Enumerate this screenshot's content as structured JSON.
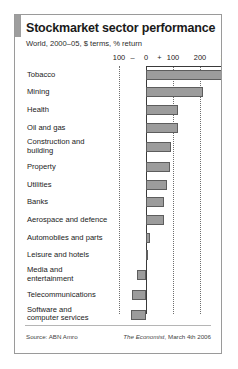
{
  "card": {
    "title": "Stockmarket sector performance",
    "subtitle": "World, 2000–05, $ terms, % return",
    "source_label": "Source: ABN Amro",
    "credit_brand": "The Economist",
    "credit_rest": ", March 4th 2006"
  },
  "axis": {
    "negative_sign": "–",
    "positive_sign": "+",
    "tick_labels": [
      "100",
      "0",
      "100",
      "200",
      "300"
    ]
  },
  "chart_data": {
    "type": "bar",
    "orientation": "horizontal",
    "title": "Stockmarket sector performance",
    "subtitle": "World, 2000–05, $ terms, % return",
    "xlabel": "% return",
    "ylabel": "",
    "xlim": [
      -100,
      300
    ],
    "xticks": [
      -100,
      0,
      100,
      200,
      300
    ],
    "xtick_labels": [
      "100",
      "0",
      "100",
      "200",
      "300"
    ],
    "grid": true,
    "legend": false,
    "categories": [
      "Tobacco",
      "Mining",
      "Health",
      "Oil and gas",
      "Construction and\nbuilding",
      "Property",
      "Utilities",
      "Banks",
      "Aerospace and defence",
      "Automobiles and parts",
      "Leisure and hotels",
      "Media and\nentertainment",
      "Telecommunications",
      "Software and\ncomputer services"
    ],
    "values": [
      307,
      210,
      120,
      118,
      94,
      88,
      79,
      66,
      66,
      15,
      7,
      -34,
      -51,
      -56
    ],
    "series": [
      {
        "name": "% return 2000–05",
        "values": [
          307,
          210,
          120,
          118,
          94,
          88,
          79,
          66,
          66,
          15,
          7,
          -34,
          -51,
          -56
        ]
      }
    ]
  },
  "colors": {
    "bar_fill": "#9c9c9c",
    "bar_stroke": "#5d5d5d",
    "accent": "#9e9e9e",
    "axis": "#3a3a3a",
    "grid": "#6e6e6e",
    "text": "#1a1a1a",
    "card_border": "#9a9a9a",
    "background": "#ffffff"
  }
}
